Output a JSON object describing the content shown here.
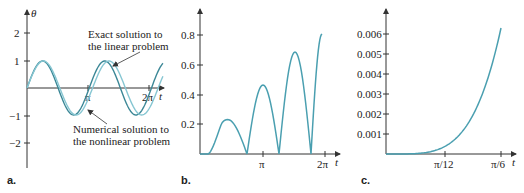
{
  "colors": {
    "curve": "#4a9fb0",
    "curve_dark": "#3b8796",
    "curve_light": "#86c6d2",
    "axis": "#333333"
  },
  "chart_data": [
    {
      "panel": "a.",
      "type": "line",
      "ylabel": "θ",
      "xlabel": "t",
      "x_ticks": [
        "π",
        "2π"
      ],
      "y_ticks": [
        "2",
        "1",
        "-1",
        "-2"
      ],
      "ylim": [
        -2.9,
        3
      ],
      "xlim": [
        0,
        2.35
      ],
      "series": [
        {
          "name": "Exact solution to the linear problem",
          "form": "sin(2t)",
          "x_range": [
            0,
            7.0
          ]
        },
        {
          "name": "Numerical solution to the nonlinear problem",
          "form": "sin(1.9t)",
          "x_range": [
            0,
            7.0
          ]
        }
      ],
      "annotations": [
        {
          "text_line1": "Exact solution to",
          "text_line2": "the linear problem"
        },
        {
          "text_line1": "Numerical solution to",
          "text_line2": "the nonlinear problem"
        }
      ]
    },
    {
      "panel": "b.",
      "type": "line",
      "xlabel": "t",
      "x_ticks": [
        "π",
        "2π"
      ],
      "y_ticks": [
        "0.8",
        "0.6",
        "0.4",
        "0.2"
      ],
      "ylim": [
        0,
        0.95
      ],
      "series": [
        {
          "name": "difference",
          "peaks": [
            [
              2.0,
              0.23
            ],
            [
              3.25,
              0.46
            ],
            [
              4.95,
              0.68
            ]
          ],
          "zeros": [
            0,
            2.5,
            4.1,
            5.7
          ],
          "end": [
            6.0,
            0.8
          ]
        }
      ]
    },
    {
      "panel": "c.",
      "type": "line",
      "xlabel": "t",
      "x_ticks": [
        "π/12",
        "π/6"
      ],
      "y_ticks": [
        "0.006",
        "0.005",
        "0.004",
        "0.003",
        "0.002",
        "0.001"
      ],
      "ylim": [
        0,
        0.0068
      ],
      "series": [
        {
          "name": "difference (small t)",
          "x": [
            0,
            0.13,
            0.26,
            0.39,
            0.52
          ],
          "values": [
            0,
            2e-05,
            0.0004,
            0.0022,
            0.0063
          ]
        }
      ]
    }
  ],
  "labels": {
    "a": {
      "panel": "a.",
      "yaxis": "θ",
      "xaxis": "t",
      "y2": "2",
      "y1": "1",
      "ym1": "−1",
      "ym2": "−2",
      "xpi": "π",
      "x2pi": "2π",
      "exact1": "Exact solution to",
      "exact2": "the linear problem",
      "num1": "Numerical solution to",
      "num2": "the nonlinear problem"
    },
    "b": {
      "panel": "b.",
      "xaxis": "t",
      "y08": "0.8",
      "y06": "0.6",
      "y04": "0.4",
      "y02": "0.2",
      "xpi": "π",
      "x2pi": "2π"
    },
    "c": {
      "panel": "c.",
      "xaxis": "t",
      "y6": "0.006",
      "y5": "0.005",
      "y4": "0.004",
      "y3": "0.003",
      "y2": "0.002",
      "y1": "0.001",
      "x12": "π/12",
      "x6": "π/6"
    }
  }
}
